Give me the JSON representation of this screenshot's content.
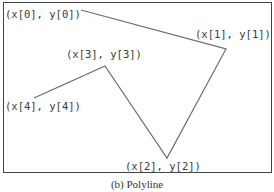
{
  "figure": {
    "caption": "(b) Polyline",
    "frame": {
      "x": 3,
      "y": 2,
      "width": 268,
      "height": 170,
      "stroke": "#444444"
    },
    "line_color": "#6b6b6b",
    "points": [
      {
        "label": "(x[0], y[0])",
        "x": 81,
        "y": 10,
        "label_x": 5,
        "label_y": 18
      },
      {
        "label": "(x[1], y[1])",
        "x": 226,
        "y": 49,
        "label_x": 195,
        "label_y": 38
      },
      {
        "label": "(x[2], y[2])",
        "x": 167,
        "y": 158,
        "label_x": 125,
        "label_y": 170
      },
      {
        "label": "(x[3], y[3])",
        "x": 105,
        "y": 66,
        "label_x": 66,
        "label_y": 58
      },
      {
        "label": "(x[4], y[4])",
        "x": 34,
        "y": 98,
        "label_x": 5,
        "label_y": 110
      }
    ]
  }
}
